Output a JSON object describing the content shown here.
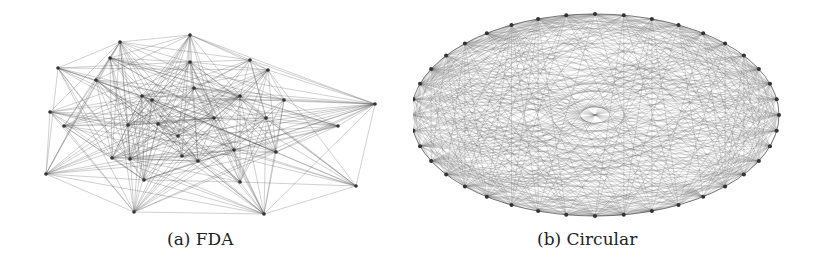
{
  "figure": {
    "panels": [
      {
        "id": "a",
        "caption": "(a) FDA",
        "layout": "force-directed",
        "nodes": [
          [
            120,
            42
          ],
          [
            190,
            35
          ],
          [
            58,
            68
          ],
          [
            110,
            58
          ],
          [
            190,
            62
          ],
          [
            250,
            60
          ],
          [
            268,
            70
          ],
          [
            96,
            80
          ],
          [
            194,
            88
          ],
          [
            142,
            96
          ],
          [
            152,
            100
          ],
          [
            240,
            96
          ],
          [
            284,
            100
          ],
          [
            375,
            104
          ],
          [
            50,
            112
          ],
          [
            64,
            126
          ],
          [
            128,
            125
          ],
          [
            158,
            124
          ],
          [
            214,
            118
          ],
          [
            266,
            118
          ],
          [
            338,
            126
          ],
          [
            112,
            158
          ],
          [
            130,
            159
          ],
          [
            178,
            136
          ],
          [
            182,
            156
          ],
          [
            198,
            161
          ],
          [
            234,
            150
          ],
          [
            276,
            152
          ],
          [
            46,
            174
          ],
          [
            144,
            180
          ],
          [
            240,
            182
          ],
          [
            356,
            186
          ],
          [
            134,
            212
          ],
          [
            264,
            214
          ]
        ],
        "edge_color": "#555555",
        "node_color": "#333333"
      },
      {
        "id": "b",
        "caption": "(b) Circular",
        "layout": "circular",
        "center": [
          182,
          115
        ],
        "rx": 184,
        "ry": 101,
        "node_count": 40,
        "edge_color": "#666666",
        "node_color": "#333333"
      }
    ]
  }
}
